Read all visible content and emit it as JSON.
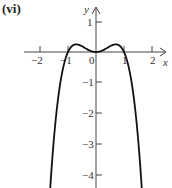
{
  "panel_label": "(vi)",
  "chart_data": {
    "type": "line",
    "title": "(vi)",
    "function": "y = x^2 - x^4",
    "xlabel": "x",
    "ylabel": "y",
    "xlim": [
      -2.3,
      2.4
    ],
    "ylim": [
      -4.4,
      1.6
    ],
    "x_ticks": [
      -2,
      -1,
      0,
      1,
      2
    ],
    "x_tick_labels": [
      "−2",
      "−1",
      "0",
      "1",
      "2"
    ],
    "y_ticks": [
      1,
      -1,
      -2,
      -3,
      -4
    ],
    "y_tick_labels": [
      "1",
      "−1",
      "−2",
      "−3",
      "−4"
    ],
    "grid": false,
    "series": [
      {
        "name": "f(x)",
        "x": [
          -1.6,
          -1.4,
          -1.2,
          -1.0,
          -0.8,
          -0.7071,
          -0.5,
          -0.3,
          0,
          0.3,
          0.5,
          0.7071,
          0.8,
          1.0,
          1.2,
          1.4,
          1.6
        ],
        "y": [
          -4.0,
          -1.88,
          -0.63,
          0,
          0.23,
          0.25,
          0.19,
          0.08,
          0,
          0.08,
          0.19,
          0.25,
          0.23,
          0,
          -0.63,
          -1.88,
          -4.0
        ]
      }
    ],
    "key_points": {
      "roots": [
        -1,
        0,
        1
      ],
      "local_maxima": [
        [
          -0.707,
          0.25
        ],
        [
          0.707,
          0.25
        ]
      ],
      "local_minimum": [
        0,
        0
      ]
    }
  }
}
